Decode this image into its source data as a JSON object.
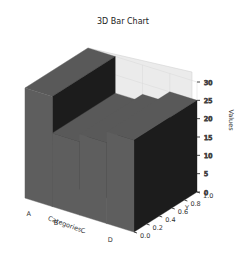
{
  "chart_data": {
    "type": "bar3d",
    "title": "3D Bar Chart",
    "xlabel": "Categories",
    "ylabel": "Y",
    "zlabel": "Values",
    "categories": [
      "A",
      "B",
      "C",
      "D"
    ],
    "values": [
      30,
      20,
      22,
      25
    ],
    "y_range": [
      0,
      1
    ],
    "zlim": [
      0,
      30
    ],
    "z_ticks": [
      "0",
      "5",
      "10",
      "15",
      "20",
      "25",
      "30"
    ],
    "y_ticks": [
      "0.0",
      "0.2",
      "0.4",
      "0.6",
      "0.8",
      "1.0"
    ],
    "grid": true,
    "bar_color": "#5a5a5a"
  }
}
